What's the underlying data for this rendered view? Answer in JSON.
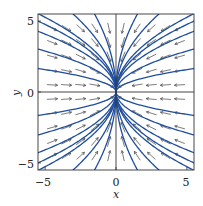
{
  "chart_data": {
    "type": "phase_portrait",
    "title": "",
    "xlabel": "x",
    "ylabel": "y",
    "xlim": [
      -5.5,
      5.5
    ],
    "ylim": [
      -5.5,
      5.5
    ],
    "xticks": [
      -5,
      0,
      5
    ],
    "yticks": [
      -5,
      0,
      5
    ],
    "xtick_labels": [
      "−5",
      "0",
      "5"
    ],
    "ytick_labels": [
      "−5",
      "0",
      "5"
    ],
    "system": "x' = -2x, y' = -y (stable node at origin)",
    "trajectory_family": "x = k*y^2",
    "trajectory_k_values": [
      -2.0,
      -0.6,
      -0.3,
      -0.18,
      -0.1,
      -0.05,
      0.05,
      0.1,
      0.18,
      0.3,
      0.6,
      2.0,
      -0.22,
      0.22
    ],
    "axis_trajectories": [
      "x-axis",
      "y-axis"
    ],
    "arrow_grid": [
      -4.5,
      -3.5,
      -2.5,
      -1.5,
      -0.5,
      0.5,
      1.5,
      2.5,
      3.5,
      4.5
    ],
    "colors": {
      "trajectory": "#1f4e9e",
      "arrow": "#444444",
      "axis": "#333333"
    },
    "grid": false,
    "legend": null
  }
}
